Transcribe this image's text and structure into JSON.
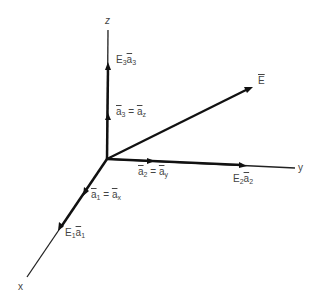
{
  "axes": {
    "x": {
      "label": "x"
    },
    "y": {
      "label": "y"
    },
    "z": {
      "label": "z"
    }
  },
  "vector": {
    "label": "E"
  },
  "unit_vectors": {
    "a1": {
      "base": "a",
      "sub": "1",
      "eq": "=",
      "alt_base": "a",
      "alt_sub": "x"
    },
    "a2": {
      "base": "a",
      "sub": "2",
      "eq": "=",
      "alt_base": "a",
      "alt_sub": "y"
    },
    "a3": {
      "base": "a",
      "sub": "3",
      "eq": "=",
      "alt_base": "a",
      "alt_sub": "z"
    }
  },
  "components": {
    "e1": {
      "coef": "E",
      "coef_sub": "1",
      "base": "a",
      "sub": "1"
    },
    "e2": {
      "coef": "E",
      "coef_sub": "2",
      "base": "a",
      "sub": "2"
    },
    "e3": {
      "coef": "E",
      "coef_sub": "3",
      "base": "a",
      "sub": "3"
    }
  },
  "colors": {
    "line": "#1a1a1a",
    "text": "#444444",
    "background": "#ffffff"
  }
}
